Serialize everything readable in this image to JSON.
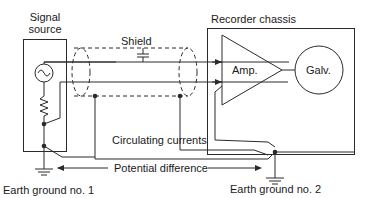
{
  "diagram": {
    "signal_source": {
      "line1": "Signal",
      "line2": "source"
    },
    "recorder_chassis": "Recorder chassis",
    "shield": "Shield",
    "amp": "Amp.",
    "galv": "Galv.",
    "circulating_currents": "Circulating currents",
    "potential_difference": "Potential difference",
    "earth_ground_1": "Earth ground no. 1",
    "earth_ground_2": "Earth ground no. 2"
  }
}
